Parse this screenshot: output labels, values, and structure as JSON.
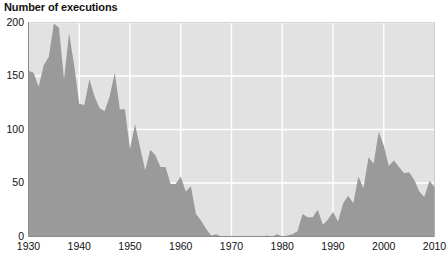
{
  "chart_data": {
    "type": "area",
    "title": "Number of executions",
    "xlabel": "",
    "ylabel": "",
    "xlim": [
      1930,
      2010
    ],
    "ylim": [
      0,
      200
    ],
    "grid": true,
    "legend": "none",
    "series_name": "Executions",
    "fill_color": "#9a9a9a",
    "plot_bg_color": "#e2e2e2",
    "grid_color": "#ffffff",
    "axis_color": "#8c8c8c",
    "text_color": "#111111",
    "page_bg_color": "#ffffff",
    "y_ticks": [
      "0",
      "50",
      "100",
      "150",
      "200"
    ],
    "y_tick_values": [
      0,
      50,
      100,
      150,
      200
    ],
    "x_ticks": [
      "1930",
      "1940",
      "1950",
      "1960",
      "1970",
      "1980",
      "1990",
      "2000",
      "2010"
    ],
    "x_tick_values": [
      1930,
      1940,
      1950,
      1960,
      1970,
      1980,
      1990,
      2000,
      2010
    ],
    "x": [
      1930,
      1931,
      1932,
      1933,
      1934,
      1935,
      1936,
      1937,
      1938,
      1939,
      1940,
      1941,
      1942,
      1943,
      1944,
      1945,
      1946,
      1947,
      1948,
      1949,
      1950,
      1951,
      1952,
      1953,
      1954,
      1955,
      1956,
      1957,
      1958,
      1959,
      1960,
      1961,
      1962,
      1963,
      1964,
      1965,
      1966,
      1967,
      1968,
      1969,
      1970,
      1971,
      1972,
      1973,
      1974,
      1975,
      1976,
      1977,
      1978,
      1979,
      1980,
      1981,
      1982,
      1983,
      1984,
      1985,
      1986,
      1987,
      1988,
      1989,
      1990,
      1991,
      1992,
      1993,
      1994,
      1995,
      1996,
      1997,
      1998,
      1999,
      2000,
      2001,
      2002,
      2003,
      2004,
      2005,
      2006,
      2007,
      2008,
      2009,
      2010
    ],
    "values": [
      155,
      153,
      140,
      160,
      168,
      199,
      195,
      147,
      190,
      160,
      124,
      123,
      147,
      131,
      120,
      117,
      131,
      153,
      119,
      119,
      82,
      105,
      83,
      62,
      81,
      76,
      65,
      65,
      49,
      49,
      56,
      42,
      47,
      21,
      15,
      7,
      1,
      2,
      0,
      0,
      0,
      0,
      0,
      0,
      0,
      0,
      0,
      1,
      0,
      2,
      0,
      1,
      2,
      5,
      21,
      18,
      18,
      25,
      11,
      16,
      23,
      14,
      31,
      38,
      31,
      56,
      45,
      74,
      68,
      98,
      85,
      66,
      71,
      65,
      59,
      60,
      53,
      42,
      37,
      52,
      46
    ]
  }
}
